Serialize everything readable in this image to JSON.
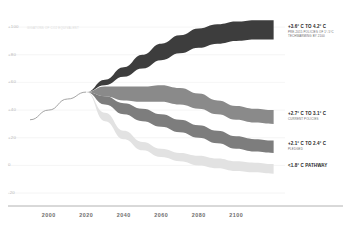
{
  "chart_data": {
    "type": "area",
    "title": "",
    "subtitle": "",
    "xlabel": "",
    "ylabel": "",
    "yunit_note": "GIGATONS OF CO2 EQUIVALENT",
    "xlim": [
      1990,
      2125
    ],
    "ylim": [
      -25,
      108
    ],
    "xticks": [
      2000,
      2020,
      2040,
      2060,
      2080,
      2100
    ],
    "yticks": [
      "+100",
      "+80",
      "+60",
      "+40",
      "+20",
      "0",
      "-20"
    ],
    "ytick_values": [
      100,
      80,
      60,
      40,
      20,
      0,
      -20
    ],
    "grid": "horizontal",
    "legend_position": "right-inline",
    "historical": {
      "name": "Historical emissions",
      "color": "#9a9a9a",
      "x": [
        1990,
        2000,
        2010,
        2020
      ],
      "values": [
        33,
        40,
        48,
        53
      ]
    },
    "series": [
      {
        "name": "Pre-2015 policies",
        "label": "+3.6° C TO 4.2° C",
        "sublabel": "PRE-2015 POLICIES OF 1°-5°C TECHWARMING BY 2100",
        "color": "#3d3d3d",
        "x": [
          2020,
          2030,
          2040,
          2050,
          2060,
          2070,
          2080,
          2090,
          2100,
          2110,
          2120
        ],
        "lower": [
          53,
          58,
          64,
          70,
          76,
          81,
          85,
          88,
          90,
          91,
          91
        ],
        "upper": [
          53,
          62,
          71,
          80,
          88,
          94,
          99,
          102,
          104,
          105,
          105
        ]
      },
      {
        "name": "Current policies",
        "label": "+2.7° C TO 3.1° C",
        "sublabel": "CURRENT POLICIES",
        "color": "#8a8a8a",
        "x": [
          2020,
          2030,
          2040,
          2050,
          2060,
          2070,
          2080,
          2090,
          2100,
          2110,
          2120
        ],
        "lower": [
          53,
          50,
          47,
          46,
          46,
          44,
          41,
          37,
          33,
          31,
          30
        ],
        "upper": [
          53,
          57,
          57,
          57,
          58,
          56,
          52,
          47,
          43,
          41,
          40
        ]
      },
      {
        "name": "Pledged",
        "label": "+2.1° C TO 2.4° C",
        "sublabel": "PLEDGED",
        "color": "#7d7d7d",
        "x": [
          2020,
          2030,
          2040,
          2050,
          2060,
          2070,
          2080,
          2090,
          2100,
          2110,
          2120
        ],
        "lower": [
          53,
          44,
          37,
          32,
          28,
          24,
          20,
          16,
          12,
          10,
          9
        ],
        "upper": [
          53,
          50,
          45,
          41,
          37,
          33,
          29,
          25,
          21,
          19,
          18
        ]
      },
      {
        "name": "Under 1.8 C pathway",
        "label": "<1.8° C PATHWAY",
        "sublabel": "",
        "color": "#e2e2e2",
        "x": [
          2020,
          2030,
          2040,
          2050,
          2060,
          2070,
          2080,
          2090,
          2100,
          2110,
          2120
        ],
        "lower": [
          53,
          32,
          19,
          11,
          6,
          3,
          0,
          -2,
          -4,
          -5,
          -6
        ],
        "upper": [
          53,
          38,
          25,
          17,
          12,
          9,
          7,
          5,
          3,
          2,
          1
        ]
      }
    ]
  },
  "axis_label_color": "#b9b9b9",
  "xaxis_label_color": "#6e6e6e",
  "gridline_color": "#eeeeee",
  "axis_line_color": "#9e9e9e"
}
